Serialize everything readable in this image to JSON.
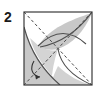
{
  "figure": {
    "type": "origami-fold-diagram",
    "step_number": "2",
    "canvas": {
      "width": 101,
      "height": 94,
      "background": "#ffffff"
    },
    "colors": {
      "outline": "#3a3a3a",
      "crease_dashed": "#4a4a4a",
      "shade_fill": "#c8c8c8",
      "shade_fill_light": "#d6d6d6",
      "arc_stroke": "#555555",
      "arrow": "#3a3a3a",
      "label_text": "#1a1a1a"
    },
    "square": {
      "name": "paper-square",
      "x": 24,
      "y": 12,
      "width": 68,
      "height": 73,
      "stroke_width": 1.1
    },
    "creases": [
      {
        "name": "diagonal-crease-tl-br",
        "style": "dashed",
        "from": [
          24,
          12
        ],
        "to": [
          92,
          85
        ]
      },
      {
        "name": "diagonal-crease-tr-bl",
        "style": "dashed",
        "from": [
          92,
          12
        ],
        "to": [
          24,
          85
        ]
      }
    ],
    "center_point": [
      58,
      48
    ],
    "arcs": [
      {
        "name": "fold-arc-upper",
        "description": "shallow arc bulging upward between left edge and right edge",
        "from": [
          38,
          46
        ],
        "control": [
          62,
          24
        ],
        "to": [
          86,
          44
        ]
      },
      {
        "name": "fold-arc-left",
        "description": "arc from top-left edge curving down to bottom vertex",
        "from": [
          24,
          28
        ],
        "control": [
          34,
          64
        ],
        "to": [
          60,
          85
        ]
      },
      {
        "name": "fold-arc-right",
        "description": "arc from top-right corner curving down-left to centre",
        "from": [
          92,
          12
        ],
        "control": [
          72,
          40
        ],
        "to": [
          44,
          50
        ]
      }
    ],
    "shaded_regions": [
      {
        "name": "shade-left-petal",
        "fill": "#c8c8c8"
      },
      {
        "name": "shade-right-lens",
        "fill": "#c8c8c8"
      },
      {
        "name": "shade-bottom-wedge",
        "fill": "#d6d6d6"
      }
    ],
    "arrow": {
      "name": "fold-direction-arrow",
      "description": "small curved arrow on lower-left indicating fold direction",
      "path_from": [
        34,
        62
      ],
      "path_to": [
        40,
        76
      ]
    }
  }
}
